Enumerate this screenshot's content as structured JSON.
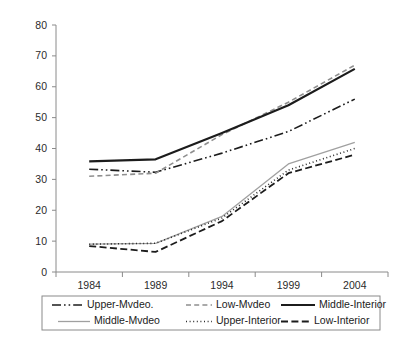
{
  "chart_data": {
    "type": "line",
    "title": "",
    "subtitle": "",
    "xlabel": "",
    "ylabel": "",
    "x": [
      "1984",
      "1989",
      "1994",
      "1999",
      "2004"
    ],
    "categories": [
      "1984",
      "1989",
      "1994",
      "1999",
      "2004"
    ],
    "xtick_labels": [
      "1984",
      "1989",
      "1994",
      "1999",
      "2004"
    ],
    "ytick_labels": [
      "0",
      "10",
      "20",
      "30",
      "40",
      "50",
      "60",
      "70",
      "80"
    ],
    "ytick_values": [
      0,
      10,
      20,
      30,
      40,
      50,
      60,
      70,
      80
    ],
    "ylim": [
      0,
      80
    ],
    "grid": false,
    "legend_position": "bottom",
    "series": [
      {
        "name": "Upper-Mvdeo.",
        "values": [
          33.3,
          32.3,
          38.5,
          45.5,
          56.0
        ],
        "style": "dash-dot-dot",
        "color": "#1c1c1c",
        "width": 1.6
      },
      {
        "name": "Low-Mvdeo",
        "values": [
          31.0,
          32.0,
          44.5,
          55.0,
          67.0
        ],
        "style": "dashed",
        "color": "#8f8f8f",
        "width": 1.6
      },
      {
        "name": "Middle-Interior",
        "values": [
          35.8,
          36.5,
          45.0,
          54.0,
          65.8
        ],
        "style": "solid",
        "color": "#1c1c1c",
        "width": 2.2
      },
      {
        "name": "Middle-Mvdeo",
        "values": [
          9.0,
          9.3,
          18.0,
          35.0,
          42.0
        ],
        "style": "solid",
        "color": "#a0a0a0",
        "width": 1.3
      },
      {
        "name": "Upper-Interior",
        "values": [
          9.0,
          9.3,
          17.5,
          33.0,
          40.0
        ],
        "style": "dotted",
        "color": "#2b2b2b",
        "width": 1.6
      },
      {
        "name": "Low-Interior",
        "values": [
          8.4,
          6.5,
          16.5,
          32.0,
          38.0
        ],
        "style": "dashed-long",
        "color": "#1c1c1c",
        "width": 1.8
      }
    ],
    "legend_rows": [
      [
        "Upper-Mvdeo.",
        "Low-Mvdeo",
        "Middle-Interior"
      ],
      [
        "Middle-Mvdeo",
        "Upper-Interior",
        "Low-Interior"
      ]
    ]
  },
  "colors": {
    "axis": "#8a8a8a",
    "text": "#1c1c1c",
    "background": "#ffffff",
    "gray_series": "#8f8f8f"
  }
}
